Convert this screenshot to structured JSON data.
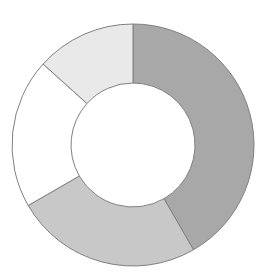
{
  "figure": {
    "background_color": "#ffffff",
    "width": 266,
    "height": 279
  },
  "chart_data": {
    "type": "pie",
    "variant": "donut",
    "title": "",
    "subtitle": "",
    "xlabel": "",
    "ylabel": "",
    "legend": false,
    "legend_position": "none",
    "grid": false,
    "labels_shown": false,
    "start_angle_deg": 0,
    "direction": "clockwise",
    "center_x": 133,
    "center_y": 145,
    "outer_radius": 121,
    "inner_radius": 62,
    "hole_color": "#ffffff",
    "stroke_color": "#808080",
    "stroke_width": 1,
    "categories": [
      "Segment 1",
      "Segment 2",
      "Segment 3",
      "Segment 4"
    ],
    "values": [
      41.7,
      25.0,
      20.0,
      13.3
    ],
    "units": "percent",
    "slices": [
      {
        "name": "Segment 1",
        "value": 41.7,
        "start_angle_deg": 0,
        "end_angle_deg": 150,
        "color": "#a8a8a8",
        "position": "right"
      },
      {
        "name": "Segment 2",
        "value": 25.0,
        "start_angle_deg": 150,
        "end_angle_deg": 240,
        "color": "#c8c8c8",
        "position": "bottom-left"
      },
      {
        "name": "Segment 3",
        "value": 20.0,
        "start_angle_deg": 240,
        "end_angle_deg": 312,
        "color": "#ffffff",
        "position": "left"
      },
      {
        "name": "Segment 4",
        "value": 13.3,
        "start_angle_deg": 312,
        "end_angle_deg": 360,
        "color": "#e9e9e9",
        "position": "top-left"
      }
    ]
  }
}
